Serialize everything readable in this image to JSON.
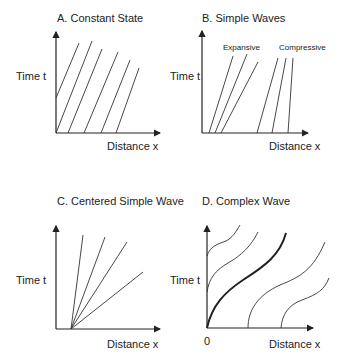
{
  "panels": {
    "a": {
      "title": "A. Constant State",
      "ylabel": "Time t",
      "xlabel": "Distance x"
    },
    "b": {
      "title": "B. Simple Waves",
      "ylabel": "Time t",
      "xlabel": "Distance x",
      "annotations": [
        "Expansive",
        "Compressive"
      ]
    },
    "c": {
      "title": "C. Centered Simple Wave",
      "ylabel": "Time t",
      "xlabel": "Distance x"
    },
    "d": {
      "title": "D. Complex Wave",
      "ylabel": "Time t",
      "xlabel": "Distance x",
      "origin_label": "0"
    }
  },
  "colors": {
    "ink": "#222222",
    "background": "#ffffff"
  }
}
